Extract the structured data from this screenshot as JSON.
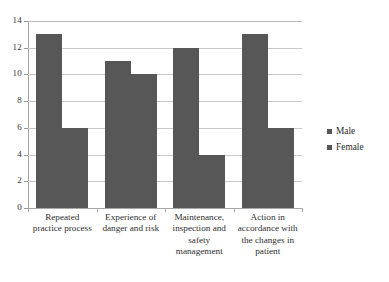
{
  "chart_data": {
    "type": "bar",
    "title": "",
    "subtitle": "",
    "xlabel": "",
    "ylabel": "",
    "ylim": [
      0,
      14
    ],
    "ytick_step": 2,
    "yticks": [
      14,
      12,
      10,
      8,
      6,
      4,
      2,
      0
    ],
    "ytick_labels": [
      "14",
      "12",
      "10",
      "8",
      "6",
      "4",
      "2",
      "0"
    ],
    "grid": true,
    "grid_axis": "y",
    "legend_position": "right",
    "orientation": "vertical",
    "grouping": "grouped",
    "categories": [
      "Repeated practice process",
      "Experience of danger and risk",
      "Maintenance, inspection and safety management",
      "Action in accordance with the changes in patient"
    ],
    "category_label_lines": [
      [
        "Repeated",
        "practice process"
      ],
      [
        "Experience of",
        "danger and risk"
      ],
      [
        "Maintenance,",
        "inspection and",
        "safety",
        "management"
      ],
      [
        "Action in",
        "accordance with",
        "the changes in",
        "patient"
      ]
    ],
    "series": [
      {
        "name": "Male",
        "values": [
          13,
          11,
          12,
          13
        ],
        "color": "#575757"
      },
      {
        "name": "Female",
        "values": [
          6,
          10,
          4,
          6
        ],
        "color": "#575757"
      }
    ],
    "annotations": []
  },
  "legend": {
    "items": [
      {
        "label": "Male",
        "marker": "square-marker",
        "color": "#575757"
      },
      {
        "label": "Female",
        "marker": "square-marker",
        "color": "#575757"
      }
    ]
  },
  "style": {
    "background": "#ffffff",
    "bar_color": "#575757",
    "gridline_color": "#c9c9c9",
    "axis_color": "#a8a8a8",
    "text_color": "#2b2b2b"
  }
}
